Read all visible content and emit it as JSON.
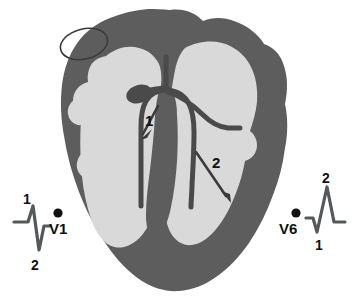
{
  "figure": {
    "type": "anatomical-diagram"
  },
  "colors": {
    "background": "#ffffff",
    "myocardium": "#5d5d5d",
    "chamber": "#d9d9d9",
    "conduction": "#4a4a4a",
    "septum": "#5d5d5d",
    "text": "#111111",
    "ecg_trace": "#55585a"
  },
  "heart": {
    "label": "heart-cross-section",
    "structures": [
      {
        "name": "sa-node-oval",
        "label": ""
      },
      {
        "name": "av-node",
        "label": ""
      },
      {
        "name": "bundle-of-his",
        "label": ""
      },
      {
        "name": "right-bundle-branch",
        "label": ""
      },
      {
        "name": "left-bundle-branch",
        "label": ""
      },
      {
        "name": "interventricular-septum",
        "label": ""
      },
      {
        "name": "right-ventricle-cavity",
        "label": ""
      },
      {
        "name": "left-ventricle-cavity",
        "label": ""
      }
    ]
  },
  "depolarization_arrows": [
    {
      "id": "arrow-1",
      "label": "1",
      "description": "septal depolarization, directed downward and leftward"
    },
    {
      "id": "arrow-2",
      "label": "2",
      "description": "free wall depolarization, directed downward and rightward"
    }
  ],
  "leads": [
    {
      "id": "v1",
      "name": "V1",
      "electrode": "v1-electrode-dot",
      "wave_labels": [
        {
          "label": "1",
          "wave": "r-wave",
          "direction": "positive"
        },
        {
          "label": "2",
          "wave": "s-wave",
          "direction": "negative"
        }
      ]
    },
    {
      "id": "v6",
      "name": "V6",
      "electrode": "v6-electrode-dot",
      "wave_labels": [
        {
          "label": "1",
          "wave": "q-wave",
          "direction": "negative"
        },
        {
          "label": "2",
          "wave": "r-wave",
          "direction": "positive"
        }
      ]
    }
  ]
}
